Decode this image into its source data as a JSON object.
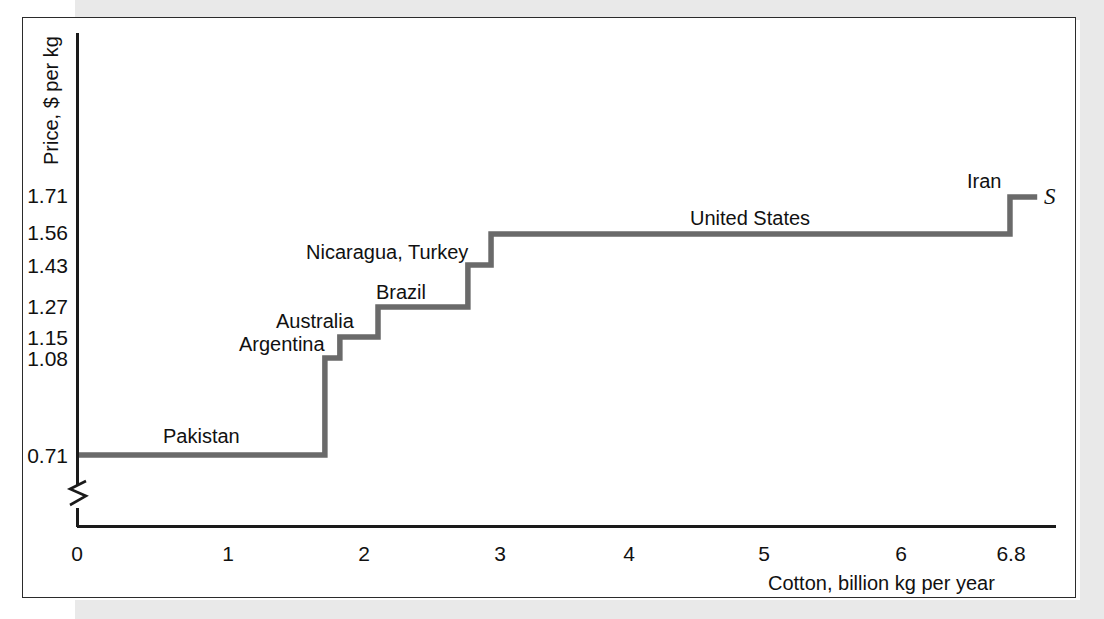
{
  "figure": {
    "y_axis_title": "Price, $ per kg",
    "x_axis_title": "Cotton, billion kg per year",
    "supply_curve_letter": "S"
  },
  "chart_data": {
    "type": "line",
    "subtype": "step",
    "title": "",
    "xlabel": "Cotton, billion kg per year",
    "ylabel": "Price, $ per kg",
    "xlim": [
      0,
      6.8
    ],
    "ylim": [
      0.71,
      1.79
    ],
    "y_axis_broken": true,
    "grid": false,
    "legend": "none",
    "series_name": "S",
    "x_ticks": [
      "0",
      "1",
      "2",
      "3",
      "4",
      "5",
      "6",
      "6.8"
    ],
    "x_tick_values": [
      0,
      1,
      2,
      3,
      4,
      5,
      6,
      6.8
    ],
    "y_ticks": [
      "0.71",
      "1.08",
      "1.15",
      "1.27",
      "1.43",
      "1.56",
      "1.71"
    ],
    "y_tick_values": [
      0.71,
      1.08,
      1.15,
      1.27,
      1.43,
      1.56,
      1.71
    ],
    "steps": [
      {
        "label": "Pakistan",
        "price": 0.71,
        "x_start": 0.0,
        "x_end": 1.82
      },
      {
        "label": "Argentina",
        "price": 1.08,
        "x_start": 1.82,
        "x_end": 1.93
      },
      {
        "label": "Australia",
        "price": 1.15,
        "x_start": 1.93,
        "x_end": 2.21
      },
      {
        "label": "Brazil",
        "price": 1.27,
        "x_start": 2.21,
        "x_end": 2.87
      },
      {
        "label": "Nicaragua, Turkey",
        "price": 1.43,
        "x_start": 2.87,
        "x_end": 3.04
      },
      {
        "label": "United States",
        "price": 1.56,
        "x_start": 3.04,
        "x_end": 6.85
      },
      {
        "label": "Iran",
        "price": 1.71,
        "x_start": 6.85,
        "x_end": 7.05
      }
    ],
    "annotations": [
      {
        "text": "Pakistan",
        "x": 0.63,
        "y": 0.75
      },
      {
        "text": "Argentina",
        "x": 1.19,
        "y": 1.1
      },
      {
        "text": "Australia",
        "x": 1.45,
        "y": 1.17
      },
      {
        "text": "Brazil",
        "x": 2.23,
        "y": 1.29
      },
      {
        "text": "Nicaragua, Turkey",
        "x": 1.56,
        "y": 1.45
      },
      {
        "text": "United States",
        "x": 3.75,
        "y": 1.58
      },
      {
        "text": "Iran",
        "x": 6.53,
        "y": 1.74
      }
    ]
  },
  "colors": {
    "curve": "#6a6a6a",
    "axis": "#1a1a1a",
    "text": "#111111",
    "frame": "#2b2b2b",
    "page_backdrop": "#e9e9e9"
  }
}
